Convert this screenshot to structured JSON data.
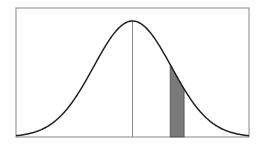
{
  "chart_data": {
    "type": "area",
    "title": "",
    "xlabel": "",
    "ylabel": "",
    "distribution": "normal",
    "mean": 0,
    "sd": 1,
    "xlim": [
      -3,
      3
    ],
    "grid": false,
    "legend": null,
    "mean_line": {
      "x": 0
    },
    "shaded_region": {
      "x_start": 0.97,
      "x_end": 1.33,
      "color": "#7a7a7a"
    },
    "curve_color": "#222222",
    "frame_color": "#999999"
  }
}
